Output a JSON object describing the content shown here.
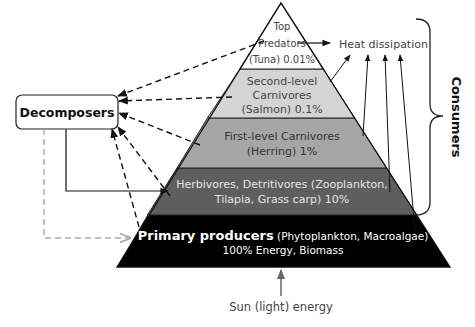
{
  "diagram": {
    "title": "",
    "layers": [
      {
        "id": "top-predators",
        "lines": [
          "Top",
          "Predators",
          "(Tuna) 0.01%"
        ],
        "fill": "#ffffff",
        "text_color": "#444444"
      },
      {
        "id": "second-level-carnivores",
        "lines": [
          "Second-level",
          "Carnivores",
          "(Salmon) 0.1%"
        ],
        "fill": "#d4d4d4",
        "text_color": "#444444"
      },
      {
        "id": "first-level-carnivores",
        "lines": [
          "First-level Carnivores",
          "(Herring) 1%"
        ],
        "fill": "#a6a6a6",
        "text_color": "#333333"
      },
      {
        "id": "herbivores",
        "lines": [
          "Herbivores, Detritivores (Zooplankton,",
          "Tilapia, Grass carp) 10%"
        ],
        "fill": "#5e5e5e",
        "text_color": "#e6e6e6"
      },
      {
        "id": "primary-producers",
        "bold": "Primary producers",
        "rest": " (Phytoplankton, Macroalgae)",
        "line2": "100% Energy, Biomass",
        "fill": "#000000",
        "text_color": "#ffffff"
      }
    ],
    "decomposers_label": "Decomposers",
    "heat_label": "Heat dissipation",
    "consumers_label": "Consumers",
    "sun_label": "Sun (light) energy"
  }
}
